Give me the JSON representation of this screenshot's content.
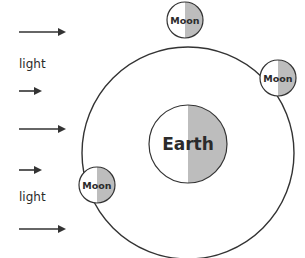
{
  "diagram": {
    "title": "",
    "light_labels": [
      "light",
      "light"
    ],
    "arrows": [
      {
        "name": "light-ray-1",
        "length": "long"
      },
      {
        "name": "light-ray-2",
        "length": "short"
      },
      {
        "name": "light-ray-3",
        "length": "long"
      },
      {
        "name": "light-ray-4",
        "length": "short"
      },
      {
        "name": "light-ray-5",
        "length": "long"
      }
    ],
    "earth": {
      "label": "Earth",
      "shaded_side": "right"
    },
    "moons": [
      {
        "label": "Moon",
        "position": "top",
        "shaded_side": "right"
      },
      {
        "label": "Moon",
        "position": "upper-right",
        "shaded_side": "right"
      },
      {
        "label": "Moon",
        "position": "lower-left",
        "shaded_side": "right"
      }
    ],
    "colors": {
      "line": "#333333",
      "shade": "#bdbdbd",
      "lit": "#ffffff",
      "text": "#2b2b2b"
    }
  }
}
